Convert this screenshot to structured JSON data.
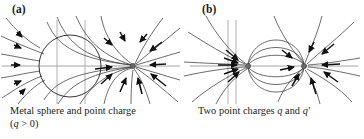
{
  "figure": {
    "background_color": "#ffffff",
    "line_color": "#3a3a3a",
    "axis_color": "#9a9a9a",
    "arrow_color": "#111111",
    "charge_color": "#555555"
  },
  "panels": [
    {
      "label": "(a)",
      "caption_line1": "Metal sphere and point charge",
      "caption_line2": "(q > 0)",
      "caption_full": "Metal sphere and point charge (q > 0)",
      "diagram_name": "metal-sphere-and-point-charge-field-lines"
    },
    {
      "label": "(b)",
      "caption_line1": "Two point charges q and q′",
      "caption_line2": "",
      "caption_full": "Two point charges q and q′",
      "diagram_name": "two-point-charges-field-lines"
    }
  ],
  "chart_data": {
    "type": "diagram",
    "subplots": [
      {
        "id": "a",
        "label": "(a)",
        "caption": "Metal sphere and point charge (q > 0)",
        "description": "Field lines of a positive point charge near a grounded conducting sphere; all field lines terminate on the sphere surface or converge on the point charge.",
        "elements": {
          "sphere": {
            "center_x": 70,
            "center_y": 52,
            "radius": 31,
            "stroke": "#3a3a3a"
          },
          "point_charge": {
            "x": 133,
            "y": 52,
            "sign": "positive",
            "label": "q"
          },
          "horizontal_axis_y": 52,
          "vertical_guides_x": [
            57,
            85
          ],
          "field_line_count": 16,
          "arrow_direction": "inward toward point charge"
        }
      },
      {
        "id": "b",
        "label": "(b)",
        "caption": "Two point charges q and q′",
        "description": "Dipole-like field lines between two point charges q and q prime; arrows converge on both charges.",
        "elements": {
          "charge_left": {
            "x": 66,
            "y": 52,
            "label": "q"
          },
          "charge_right": {
            "x": 122,
            "y": 52,
            "label": "q′"
          },
          "horizontal_axis_y": 52,
          "vertical_guides_x": [
            46,
            54
          ],
          "field_line_count": 16,
          "arrow_direction": "inward toward both charges"
        }
      }
    ]
  }
}
